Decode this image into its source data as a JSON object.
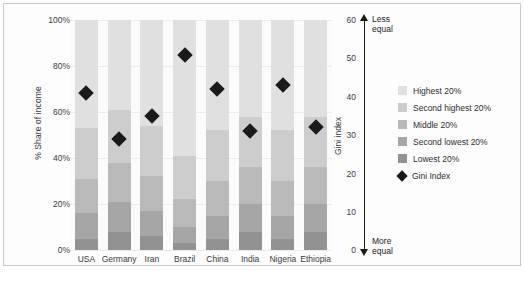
{
  "chart_data": {
    "type": "bar",
    "title": "",
    "categories": [
      "USA",
      "Germany",
      "Iran",
      "Brazil",
      "China",
      "India",
      "Nigeria",
      "Ethiopia"
    ],
    "xlabel": "",
    "ylabel": "% Share of income",
    "ylim": [
      0,
      100
    ],
    "ytick_labels": [
      "0%",
      "20%",
      "40%",
      "60%",
      "80%",
      "100%"
    ],
    "ytick_values": [
      0,
      20,
      40,
      60,
      80,
      100
    ],
    "y2label": "Gini index",
    "y2lim": [
      0,
      60
    ],
    "y2tick_labels": [
      "0",
      "10",
      "20",
      "30",
      "40",
      "50",
      "60"
    ],
    "y2tick_values": [
      0,
      10,
      20,
      30,
      40,
      50,
      60
    ],
    "grid": true,
    "stacked": true,
    "legend_position": "right",
    "series": [
      {
        "name": "Lowest 20%",
        "color": "#929292",
        "values": [
          5,
          8,
          6,
          3,
          5,
          8,
          5,
          8
        ]
      },
      {
        "name": "Second lowest 20%",
        "color": "#a6a6a6",
        "values": [
          11,
          13,
          11,
          7,
          10,
          12,
          10,
          12
        ]
      },
      {
        "name": "Middle 20%",
        "color": "#b9b9b9",
        "values": [
          15,
          17,
          15,
          12,
          15,
          16,
          15,
          16
        ]
      },
      {
        "name": "Second highest 20%",
        "color": "#cdcdcd",
        "values": [
          22,
          23,
          22,
          19,
          22,
          22,
          22,
          22
        ]
      },
      {
        "name": "Highest 20%",
        "color": "#e0e0e0",
        "values": [
          47,
          39,
          46,
          59,
          48,
          42,
          48,
          42
        ]
      }
    ],
    "marker_series": {
      "name": "Gini Index",
      "marker": "diamond",
      "color": "#1a1a1a",
      "values": [
        41,
        29,
        35,
        51,
        42,
        31,
        43,
        32
      ]
    },
    "annotations": {
      "top_arrow_label": "Less\nequal",
      "top_arrow_label_line1": "Less",
      "top_arrow_label_line2": "equal",
      "bottom_arrow_label_line1": "More",
      "bottom_arrow_label_line2": "equal"
    }
  },
  "legend": {
    "items": [
      {
        "label": "Highest 20%",
        "swatch": "#e0e0e0",
        "type": "swatch"
      },
      {
        "label": "Second highest 20%",
        "swatch": "#cdcdcd",
        "type": "swatch"
      },
      {
        "label": "Middle 20%",
        "swatch": "#b9b9b9",
        "type": "swatch"
      },
      {
        "label": "Second lowest 20%",
        "swatch": "#a6a6a6",
        "type": "swatch"
      },
      {
        "label": "Lowest 20%",
        "swatch": "#929292",
        "type": "swatch"
      },
      {
        "label": "Gini Index",
        "swatch": "#1a1a1a",
        "type": "diamond"
      }
    ]
  },
  "footer": {
    "caption": ""
  }
}
